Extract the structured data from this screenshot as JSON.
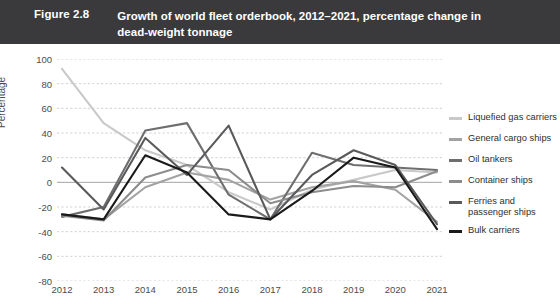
{
  "header": {
    "figure_number": "Figure 2.8",
    "title": "Growth of world fleet orderbook, 2012–2021, percentage change in dead-weight tonnage",
    "background_color": "#3a3a3c",
    "text_color": "#ffffff"
  },
  "axes": {
    "ylabel": "Percentage",
    "yticks": [
      "100",
      "80",
      "60",
      "40",
      "20",
      "0",
      "-20",
      "-40",
      "-60",
      "-80"
    ],
    "xticks": [
      "2012",
      "2013",
      "2014",
      "2015",
      "2016",
      "2017",
      "2018",
      "2019",
      "2020",
      "2021"
    ]
  },
  "legend": {
    "position": "right",
    "items": [
      {
        "label": "Liquefied gas carriers",
        "color": "#c9c9c9"
      },
      {
        "label": "General cargo ships",
        "color": "#a3a3a3"
      },
      {
        "label": "Oil tankers",
        "color": "#6e6e70"
      },
      {
        "label": "Container ships",
        "color": "#8c8c8e"
      },
      {
        "label": "Ferries and passenger ships",
        "color": "#5a5a5c"
      },
      {
        "label": "Bulk carriers",
        "color": "#1a1a1a"
      }
    ]
  },
  "chart_data": {
    "type": "line",
    "title": "Growth of world fleet orderbook, 2012–2021, percentage change in dead-weight tonnage",
    "xlabel": "",
    "ylabel": "Percentage",
    "x": [
      2012,
      2013,
      2014,
      2015,
      2016,
      2017,
      2018,
      2019,
      2020,
      2021
    ],
    "ylim": [
      -80,
      100
    ],
    "ytick_step": 20,
    "grid": true,
    "grid_style": "dashed-horizontal",
    "zero_line": true,
    "series": [
      {
        "name": "Liquefied gas carriers",
        "color": "#c9c9c9",
        "values": [
          92,
          48,
          26,
          14,
          -8,
          -22,
          -6,
          2,
          10,
          8
        ]
      },
      {
        "name": "General cargo ships",
        "color": "#a3a3a3",
        "values": [
          -26,
          -30,
          -4,
          8,
          2,
          -14,
          -4,
          1,
          -6,
          -32
        ]
      },
      {
        "name": "Oil tankers",
        "color": "#6e6e70",
        "values": [
          -28,
          -20,
          42,
          48,
          -10,
          -30,
          24,
          14,
          12,
          10
        ]
      },
      {
        "name": "Container ships",
        "color": "#8c8c8e",
        "values": [
          -27,
          -31,
          4,
          14,
          10,
          -17,
          -8,
          -3,
          -4,
          9
        ]
      },
      {
        "name": "Ferries and passenger ships",
        "color": "#5a5a5c",
        "values": [
          12,
          -22,
          36,
          6,
          46,
          -30,
          6,
          26,
          14,
          -34
        ]
      },
      {
        "name": "Bulk carriers",
        "color": "#1a1a1a",
        "values": [
          -26,
          -30,
          22,
          8,
          -26,
          -30,
          -7,
          20,
          12,
          -38
        ]
      }
    ]
  }
}
